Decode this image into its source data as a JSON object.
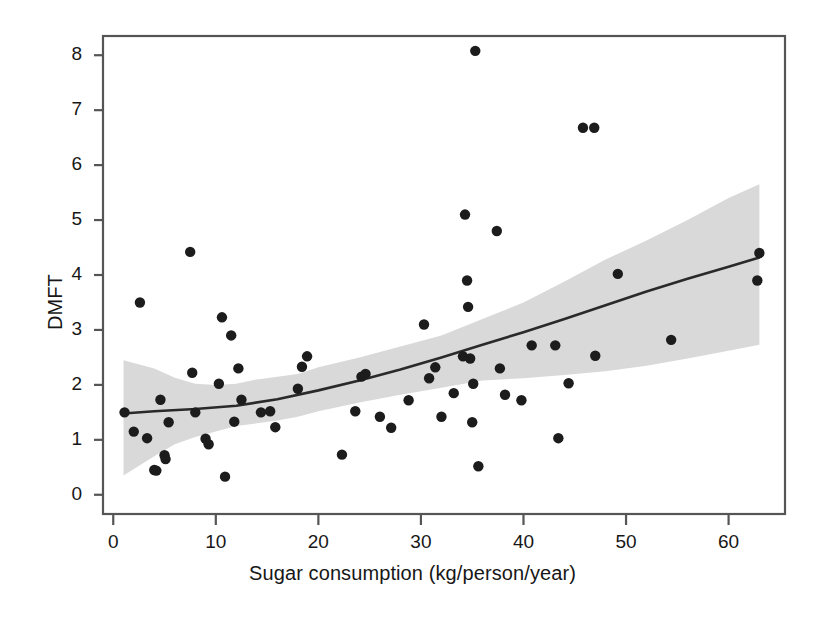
{
  "chart_data": {
    "type": "scatter",
    "title": "",
    "xlabel": "Sugar consumption (kg/person/year)",
    "ylabel": "DMFT",
    "xlim": [
      -1.0,
      65.5
    ],
    "ylim": [
      -0.35,
      8.35
    ],
    "xticks": [
      0,
      10,
      20,
      30,
      40,
      50,
      60
    ],
    "xtick_labels": [
      "0",
      "10",
      "20",
      "30",
      "40",
      "50",
      "60"
    ],
    "yticks": [
      0,
      1,
      2,
      3,
      4,
      5,
      6,
      7,
      8
    ],
    "ytick_labels": [
      "0",
      "1",
      "2",
      "3",
      "4",
      "5",
      "6",
      "7",
      "8"
    ],
    "grid": false,
    "legend": null,
    "point_color": "#1c1c1c",
    "point_radius": 5.2,
    "fit_line_color": "#2a2a2a",
    "confidence_band_color": "#d9d9d9",
    "frame_color": "#555555",
    "points": [
      {
        "x": 1.1,
        "y": 1.5
      },
      {
        "x": 2.0,
        "y": 1.15
      },
      {
        "x": 2.6,
        "y": 3.5
      },
      {
        "x": 3.3,
        "y": 1.03
      },
      {
        "x": 4.0,
        "y": 0.45
      },
      {
        "x": 4.2,
        "y": 0.44
      },
      {
        "x": 4.6,
        "y": 1.73
      },
      {
        "x": 5.0,
        "y": 0.72
      },
      {
        "x": 5.1,
        "y": 0.65
      },
      {
        "x": 5.4,
        "y": 1.32
      },
      {
        "x": 7.5,
        "y": 4.42
      },
      {
        "x": 7.7,
        "y": 2.22
      },
      {
        "x": 8.0,
        "y": 1.5
      },
      {
        "x": 9.0,
        "y": 1.02
      },
      {
        "x": 9.3,
        "y": 0.92
      },
      {
        "x": 10.3,
        "y": 2.02
      },
      {
        "x": 10.6,
        "y": 3.23
      },
      {
        "x": 10.9,
        "y": 0.33
      },
      {
        "x": 11.5,
        "y": 2.9
      },
      {
        "x": 11.8,
        "y": 1.33
      },
      {
        "x": 12.2,
        "y": 2.3
      },
      {
        "x": 12.5,
        "y": 1.73
      },
      {
        "x": 14.4,
        "y": 1.5
      },
      {
        "x": 15.3,
        "y": 1.52
      },
      {
        "x": 15.8,
        "y": 1.23
      },
      {
        "x": 18.0,
        "y": 1.93
      },
      {
        "x": 18.4,
        "y": 2.33
      },
      {
        "x": 18.9,
        "y": 2.52
      },
      {
        "x": 22.3,
        "y": 0.73
      },
      {
        "x": 23.6,
        "y": 1.52
      },
      {
        "x": 24.2,
        "y": 2.15
      },
      {
        "x": 24.6,
        "y": 2.2
      },
      {
        "x": 26.0,
        "y": 1.42
      },
      {
        "x": 27.1,
        "y": 1.22
      },
      {
        "x": 28.8,
        "y": 1.72
      },
      {
        "x": 30.3,
        "y": 3.1
      },
      {
        "x": 30.8,
        "y": 2.12
      },
      {
        "x": 31.4,
        "y": 2.32
      },
      {
        "x": 32.0,
        "y": 1.42
      },
      {
        "x": 33.2,
        "y": 1.85
      },
      {
        "x": 34.1,
        "y": 2.52
      },
      {
        "x": 34.3,
        "y": 5.1
      },
      {
        "x": 34.5,
        "y": 3.9
      },
      {
        "x": 34.6,
        "y": 3.42
      },
      {
        "x": 34.8,
        "y": 2.48
      },
      {
        "x": 35.0,
        "y": 1.32
      },
      {
        "x": 35.1,
        "y": 2.02
      },
      {
        "x": 35.3,
        "y": 8.08
      },
      {
        "x": 35.6,
        "y": 0.52
      },
      {
        "x": 37.4,
        "y": 4.8
      },
      {
        "x": 37.7,
        "y": 2.3
      },
      {
        "x": 38.2,
        "y": 1.82
      },
      {
        "x": 39.8,
        "y": 1.72
      },
      {
        "x": 40.8,
        "y": 2.72
      },
      {
        "x": 43.1,
        "y": 2.72
      },
      {
        "x": 43.4,
        "y": 1.03
      },
      {
        "x": 44.4,
        "y": 2.03
      },
      {
        "x": 45.8,
        "y": 6.68
      },
      {
        "x": 46.9,
        "y": 6.68
      },
      {
        "x": 47.0,
        "y": 2.53
      },
      {
        "x": 49.2,
        "y": 4.02
      },
      {
        "x": 54.4,
        "y": 2.82
      },
      {
        "x": 62.8,
        "y": 3.9
      },
      {
        "x": 63.0,
        "y": 4.4
      }
    ],
    "fit_line": [
      {
        "x": 1.0,
        "y": 1.48
      },
      {
        "x": 4.0,
        "y": 1.52
      },
      {
        "x": 8.0,
        "y": 1.56
      },
      {
        "x": 12.0,
        "y": 1.62
      },
      {
        "x": 16.0,
        "y": 1.74
      },
      {
        "x": 20.0,
        "y": 1.9
      },
      {
        "x": 24.0,
        "y": 2.08
      },
      {
        "x": 28.0,
        "y": 2.28
      },
      {
        "x": 32.0,
        "y": 2.5
      },
      {
        "x": 36.0,
        "y": 2.73
      },
      {
        "x": 40.0,
        "y": 2.96
      },
      {
        "x": 44.0,
        "y": 3.2
      },
      {
        "x": 48.0,
        "y": 3.45
      },
      {
        "x": 52.0,
        "y": 3.7
      },
      {
        "x": 56.0,
        "y": 3.93
      },
      {
        "x": 60.0,
        "y": 4.15
      },
      {
        "x": 63.0,
        "y": 4.32
      }
    ],
    "confidence_band_upper": [
      {
        "x": 1.0,
        "y": 2.45
      },
      {
        "x": 4.0,
        "y": 2.3
      },
      {
        "x": 6.0,
        "y": 2.13
      },
      {
        "x": 8.0,
        "y": 2.02
      },
      {
        "x": 10.0,
        "y": 2.0
      },
      {
        "x": 12.0,
        "y": 2.02
      },
      {
        "x": 14.0,
        "y": 2.1
      },
      {
        "x": 16.0,
        "y": 2.15
      },
      {
        "x": 18.0,
        "y": 2.2
      },
      {
        "x": 20.0,
        "y": 2.32
      },
      {
        "x": 24.0,
        "y": 2.5
      },
      {
        "x": 28.0,
        "y": 2.7
      },
      {
        "x": 32.0,
        "y": 2.9
      },
      {
        "x": 36.0,
        "y": 3.2
      },
      {
        "x": 40.0,
        "y": 3.5
      },
      {
        "x": 44.0,
        "y": 3.88
      },
      {
        "x": 48.0,
        "y": 4.28
      },
      {
        "x": 52.0,
        "y": 4.63
      },
      {
        "x": 56.0,
        "y": 5.0
      },
      {
        "x": 60.0,
        "y": 5.4
      },
      {
        "x": 63.0,
        "y": 5.65
      }
    ],
    "confidence_band_lower": [
      {
        "x": 1.0,
        "y": 0.35
      },
      {
        "x": 4.0,
        "y": 0.7
      },
      {
        "x": 6.0,
        "y": 0.92
      },
      {
        "x": 8.0,
        "y": 1.05
      },
      {
        "x": 10.0,
        "y": 1.15
      },
      {
        "x": 12.0,
        "y": 1.25
      },
      {
        "x": 14.0,
        "y": 1.3
      },
      {
        "x": 16.0,
        "y": 1.35
      },
      {
        "x": 18.0,
        "y": 1.42
      },
      {
        "x": 20.0,
        "y": 1.52
      },
      {
        "x": 24.0,
        "y": 1.68
      },
      {
        "x": 28.0,
        "y": 1.82
      },
      {
        "x": 32.0,
        "y": 1.95
      },
      {
        "x": 36.0,
        "y": 2.08
      },
      {
        "x": 40.0,
        "y": 2.12
      },
      {
        "x": 44.0,
        "y": 2.18
      },
      {
        "x": 48.0,
        "y": 2.25
      },
      {
        "x": 52.0,
        "y": 2.35
      },
      {
        "x": 56.0,
        "y": 2.48
      },
      {
        "x": 60.0,
        "y": 2.62
      },
      {
        "x": 63.0,
        "y": 2.73
      }
    ]
  }
}
